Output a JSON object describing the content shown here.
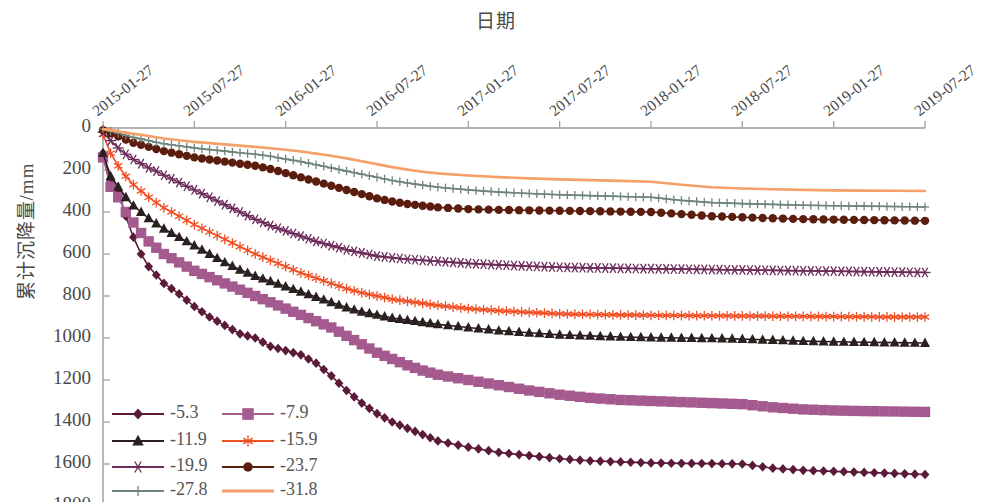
{
  "chart_data": {
    "type": "line",
    "title": "日期",
    "xlabel": "日期",
    "ylabel": "累计沉降量/mm",
    "y_inverted": true,
    "ylim": [
      0,
      1800
    ],
    "ytick_labels": [
      "0",
      "200",
      "400",
      "600",
      "800",
      "1000",
      "1200",
      "1400",
      "1600",
      "1800"
    ],
    "ytick_values": [
      0,
      200,
      400,
      600,
      800,
      1000,
      1200,
      1400,
      1600,
      1800
    ],
    "xtick_labels": [
      "2015-01-27",
      "2015-07-27",
      "2016-01-27",
      "2016-07-27",
      "2017-01-27",
      "2017-07-27",
      "2018-01-27",
      "2018-07-27",
      "2019-01-27",
      "2019-07-27"
    ],
    "x_range_months": [
      0,
      54
    ],
    "grid": false,
    "legend_position": "lower-left",
    "series": [
      {
        "name": "-5.3",
        "color": "#5b1b38",
        "marker": "diamond",
        "x": [
          0,
          0.5,
          1,
          1.5,
          2,
          2.5,
          3,
          3.5,
          4,
          5,
          6,
          7,
          8,
          9,
          10,
          11,
          12,
          13,
          14,
          15,
          16,
          17,
          18,
          19,
          20,
          21,
          22,
          24,
          26,
          28,
          30,
          32,
          34,
          36,
          38,
          40,
          42,
          44,
          46,
          48,
          50,
          52,
          54
        ],
        "y": [
          120,
          250,
          300,
          420,
          520,
          600,
          660,
          700,
          740,
          790,
          850,
          900,
          940,
          980,
          1000,
          1040,
          1060,
          1080,
          1120,
          1180,
          1250,
          1310,
          1360,
          1400,
          1430,
          1460,
          1490,
          1520,
          1545,
          1560,
          1575,
          1585,
          1590,
          1595,
          1597,
          1598,
          1600,
          1620,
          1630,
          1635,
          1640,
          1645,
          1650
        ]
      },
      {
        "name": "-7.9",
        "color": "#a45a8e",
        "marker": "square",
        "x": [
          0,
          0.5,
          1,
          1.5,
          2,
          2.5,
          3,
          3.5,
          4,
          5,
          6,
          7,
          8,
          9,
          10,
          11,
          12,
          13,
          14,
          15,
          16,
          17,
          18,
          19,
          20,
          21,
          22,
          24,
          26,
          28,
          30,
          32,
          34,
          36,
          38,
          40,
          42,
          44,
          46,
          48,
          50,
          52,
          54
        ],
        "y": [
          140,
          280,
          330,
          400,
          450,
          500,
          540,
          570,
          600,
          640,
          680,
          710,
          740,
          770,
          800,
          830,
          860,
          890,
          920,
          950,
          990,
          1030,
          1070,
          1100,
          1130,
          1155,
          1175,
          1200,
          1225,
          1250,
          1270,
          1285,
          1295,
          1300,
          1305,
          1310,
          1315,
          1330,
          1340,
          1345,
          1348,
          1350,
          1352
        ]
      },
      {
        "name": "-11.9",
        "color": "#2b2020",
        "marker": "triangle",
        "x": [
          0,
          0.5,
          1,
          1.5,
          2,
          2.5,
          3,
          3.5,
          4,
          5,
          6,
          7,
          8,
          9,
          10,
          11,
          12,
          13,
          14,
          15,
          16,
          17,
          18,
          19,
          20,
          21,
          22,
          24,
          26,
          28,
          30,
          32,
          34,
          36,
          38,
          40,
          42,
          44,
          46,
          48,
          50,
          52,
          54
        ],
        "y": [
          120,
          230,
          280,
          330,
          370,
          400,
          430,
          455,
          480,
          520,
          560,
          600,
          640,
          675,
          705,
          730,
          755,
          780,
          805,
          830,
          855,
          875,
          890,
          905,
          915,
          925,
          935,
          950,
          965,
          975,
          985,
          990,
          995,
          998,
          1000,
          1002,
          1005,
          1010,
          1015,
          1018,
          1020,
          1022,
          1024
        ]
      },
      {
        "name": "-15.9",
        "color": "#f04e23",
        "marker": "asterisk",
        "x": [
          0,
          0.5,
          1,
          1.5,
          2,
          2.5,
          3,
          3.5,
          4,
          5,
          6,
          7,
          8,
          9,
          10,
          11,
          12,
          13,
          14,
          15,
          16,
          17,
          18,
          19,
          20,
          21,
          22,
          24,
          26,
          28,
          30,
          32,
          34,
          36,
          38,
          40,
          42,
          44,
          46,
          48,
          50,
          52,
          54
        ],
        "y": [
          30,
          120,
          180,
          230,
          270,
          300,
          330,
          355,
          380,
          420,
          460,
          495,
          530,
          565,
          600,
          630,
          660,
          690,
          715,
          740,
          765,
          785,
          800,
          815,
          825,
          835,
          845,
          860,
          870,
          878,
          885,
          888,
          890,
          892,
          893,
          894,
          895,
          896,
          897,
          898,
          899,
          900,
          900
        ]
      },
      {
        "name": "-19.9",
        "color": "#6b2a58",
        "marker": "star",
        "x": [
          0,
          0.5,
          1,
          1.5,
          2,
          2.5,
          3,
          3.5,
          4,
          5,
          6,
          7,
          8,
          9,
          10,
          11,
          12,
          13,
          14,
          15,
          16,
          17,
          18,
          19,
          20,
          21,
          22,
          24,
          26,
          28,
          30,
          32,
          34,
          36,
          38,
          40,
          42,
          44,
          46,
          48,
          50,
          52,
          54
        ],
        "y": [
          20,
          60,
          95,
          125,
          150,
          170,
          190,
          205,
          225,
          260,
          295,
          330,
          365,
          400,
          435,
          465,
          490,
          515,
          540,
          560,
          580,
          595,
          610,
          618,
          625,
          630,
          635,
          645,
          652,
          658,
          663,
          666,
          668,
          670,
          672,
          674,
          676,
          678,
          680,
          682,
          684,
          686,
          688
        ]
      },
      {
        "name": "-23.7",
        "color": "#5b1d0e",
        "marker": "circle",
        "x": [
          0,
          0.5,
          1,
          1.5,
          2,
          2.5,
          3,
          3.5,
          4,
          5,
          6,
          7,
          8,
          9,
          10,
          11,
          12,
          13,
          14,
          15,
          16,
          17,
          18,
          19,
          20,
          21,
          22,
          24,
          26,
          28,
          30,
          32,
          34,
          36,
          38,
          40,
          42,
          44,
          46,
          48,
          50,
          52,
          54
        ],
        "y": [
          10,
          25,
          40,
          55,
          70,
          80,
          90,
          100,
          110,
          125,
          140,
          150,
          160,
          170,
          180,
          195,
          215,
          235,
          255,
          275,
          295,
          315,
          335,
          350,
          362,
          370,
          378,
          386,
          390,
          392,
          394,
          396,
          398,
          400,
          410,
          420,
          425,
          430,
          434,
          436,
          438,
          440,
          442
        ]
      },
      {
        "name": "-27.8",
        "color": "#6e8478",
        "marker": "plus",
        "x": [
          0,
          0.5,
          1,
          1.5,
          2,
          2.5,
          3,
          3.5,
          4,
          5,
          6,
          7,
          8,
          9,
          10,
          11,
          12,
          13,
          14,
          15,
          16,
          17,
          18,
          19,
          20,
          21,
          22,
          24,
          26,
          28,
          30,
          32,
          34,
          36,
          38,
          40,
          42,
          44,
          46,
          48,
          50,
          52,
          54
        ],
        "y": [
          5,
          15,
          25,
          35,
          45,
          52,
          60,
          68,
          75,
          85,
          95,
          103,
          110,
          118,
          125,
          135,
          148,
          160,
          175,
          190,
          205,
          220,
          235,
          250,
          262,
          272,
          282,
          295,
          305,
          312,
          318,
          322,
          326,
          330,
          345,
          355,
          360,
          364,
          368,
          370,
          372,
          374,
          376
        ]
      },
      {
        "name": "-31.8",
        "color": "#f4a068",
        "marker": "none",
        "x": [
          0,
          0.5,
          1,
          1.5,
          2,
          2.5,
          3,
          3.5,
          4,
          5,
          6,
          7,
          8,
          9,
          10,
          11,
          12,
          13,
          14,
          15,
          16,
          17,
          18,
          19,
          20,
          21,
          22,
          24,
          26,
          28,
          30,
          32,
          34,
          36,
          38,
          40,
          42,
          44,
          46,
          48,
          50,
          52,
          54
        ],
        "y": [
          5,
          10,
          16,
          22,
          28,
          32,
          38,
          44,
          50,
          58,
          66,
          72,
          78,
          84,
          90,
          96,
          104,
          112,
          122,
          132,
          145,
          158,
          172,
          186,
          198,
          208,
          216,
          226,
          234,
          240,
          245,
          248,
          252,
          256,
          270,
          282,
          288,
          292,
          295,
          297,
          298,
          299,
          300
        ]
      }
    ]
  },
  "legend": {
    "entries": [
      {
        "label": "-5.3",
        "color": "#5b1b38",
        "marker": "diamond"
      },
      {
        "label": "-7.9",
        "color": "#a45a8e",
        "marker": "square"
      },
      {
        "label": "-11.9",
        "color": "#2b2020",
        "marker": "triangle"
      },
      {
        "label": "-15.9",
        "color": "#f04e23",
        "marker": "asterisk"
      },
      {
        "label": "-19.9",
        "color": "#6b2a58",
        "marker": "star"
      },
      {
        "label": "-23.7",
        "color": "#5b1d0e",
        "marker": "circle"
      },
      {
        "label": "-27.8",
        "color": "#6e8478",
        "marker": "plus"
      },
      {
        "label": "-31.8",
        "color": "#f4a068",
        "marker": "none"
      }
    ]
  }
}
